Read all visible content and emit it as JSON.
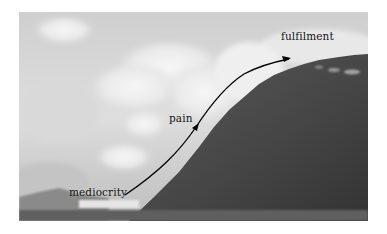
{
  "figure": {
    "labels": {
      "start": "mediocrity",
      "middle": "pain",
      "end": "fulfilment"
    },
    "colors": {
      "sky": "#d8d8d8",
      "clouds": "#f2f2f2",
      "mountain": "#4a4a4a",
      "mountain_dark": "#383838",
      "arrow": "#000000",
      "text": "#111111"
    }
  }
}
